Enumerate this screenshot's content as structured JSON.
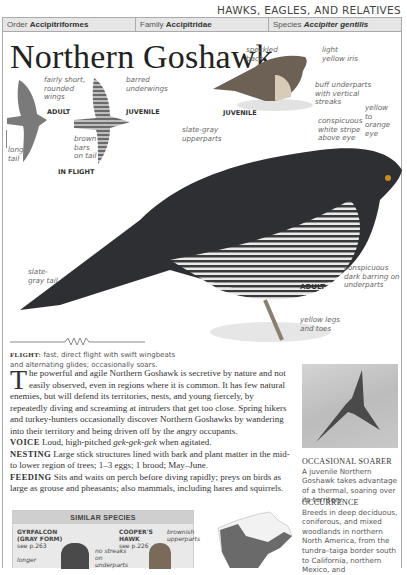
{
  "header": {
    "section": "HAWKS, EAGLES, AND RELATIVES",
    "order_label": "Order",
    "order_value": "Accipitriformes",
    "family_label": "Family",
    "family_value": "Accipitridae",
    "species_label": "Species",
    "species_value": "Accipiter gentilis"
  },
  "title": "Northern Goshawk",
  "illustrations": {
    "flight_adult_tag": "ADULT",
    "flight_juvenile_tag": "JUVENILE",
    "in_flight_tag": "IN FLIGHT",
    "perched_juvenile_tag": "JUVENILE",
    "adult_tag": "ADULT",
    "labels": {
      "fairly_short_wings": "fairly short, rounded wings",
      "long_tail": "long tail",
      "barred_underwings": "barred underwings",
      "brown_bars": "brown bars on tail",
      "speckled_back": "speckled back",
      "light_yellow_iris": "light yellow iris",
      "buff_underparts": "buff underparts with vertical streaks",
      "yellow_orange_eye": "yellow to orange eye",
      "white_stripe": "conspicuous white stripe above eye",
      "slate_gray_upperparts": "slate-gray upperparts",
      "slate_gray_tail": "slate-gray tail",
      "dark_barring": "conspicuous dark barring on underparts",
      "yellow_legs": "yellow legs and toes"
    }
  },
  "flight": {
    "label": "FLIGHT:",
    "text": "fast, direct flight with swift wingbeats and alternating glides; occasionally soars."
  },
  "description": {
    "dropcap": "T",
    "intro": "he powerful and agile Northern Goshawk is secretive by nature and not easily observed, even in regions where it is common. It has few natural enemies, but will defend its territories, nests, and young fiercely, by repeatedly diving and screaming at intruders that get too close. Spring hikers and turkey-hunters occasionally discover Northern Goshawks by wandering into their territory and being driven off by the angry occupants.",
    "voice_label": "VOICE",
    "voice_text_pre": "Loud, high-pitched ",
    "voice_call": "gek-gek-gek",
    "voice_text_post": " when agitated.",
    "nesting_label": "NESTING",
    "nesting_text": "Large stick structures lined with bark and plant matter in the mid- to lower region of trees; 1–3 eggs; 1 brood; May–June.",
    "feeding_label": "FEEDING",
    "feeding_text": "Sits and waits on perch before diving rapidly; preys on birds as large as grouse and pheasants; also mammals, including hares and squirrels."
  },
  "similar_species": {
    "header": "SIMILAR SPECIES",
    "gyrfalcon_name": "GYRFALCON (GRAY FORM)",
    "gyrfalcon_ref": "see p.263",
    "gyrfalcon_note": "longer",
    "no_streaks": "no streaks on underparts",
    "coopers_name": "COOPER'S HAWK",
    "coopers_ref": "see p.226",
    "coopers_note": "brownish upperparts"
  },
  "sidebar": {
    "photo_caption_title": "OCCASIONAL SOARER",
    "photo_caption_text": "A juvenile Northern Goshawk takes advantage of a thermal, soaring over its territory.",
    "occurrence_title": "OCCURRENCE",
    "occurrence_text": "Breeds in deep deciduous, coniferous, and mixed woodlands in northern North America, from the tundra–taiga border south to California, northern Mexico, and"
  }
}
